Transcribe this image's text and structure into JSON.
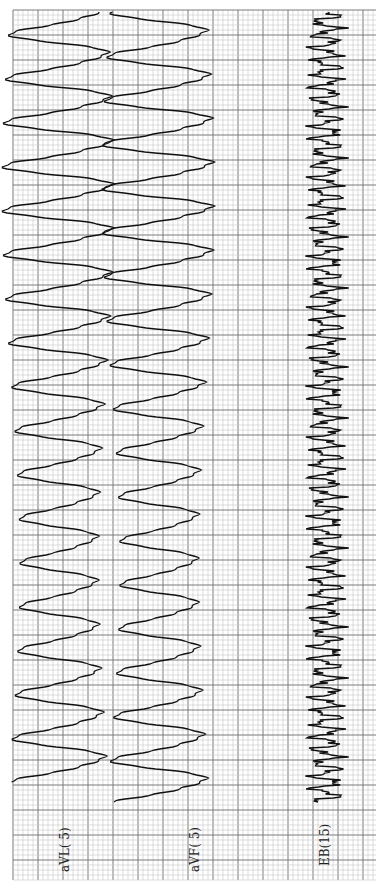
{
  "chart_data": {
    "type": "line",
    "title": "",
    "orientation": "rotated-90 (time runs top to bottom)",
    "grid": {
      "x0": 13,
      "y0": 10,
      "x1": 376,
      "y1": 880,
      "minor_px": 5,
      "major_px": 25,
      "minor_color": "#c8c8c8",
      "major_color": "#7a7a7a",
      "background": "#ffffff"
    },
    "series": [
      {
        "name": "aVL( 5)",
        "baseline_x": 62,
        "amplitude_px": 52,
        "period_px": 44,
        "phase": 0.0,
        "y_start": 12,
        "y_end": 782,
        "shape": "polymorphic-sine",
        "color": "#111111"
      },
      {
        "name": "aVF( 5)",
        "baseline_x": 162,
        "amplitude_px": 52,
        "period_px": 44,
        "phase": 3.14,
        "y_start": 12,
        "y_end": 802,
        "shape": "polymorphic-sine",
        "color": "#111111"
      },
      {
        "name": "EB(15)",
        "baseline_x": 326,
        "amplitude_px": 18,
        "period_px": 13,
        "phase": 0.4,
        "y_start": 12,
        "y_end": 802,
        "shape": "spiky",
        "color": "#111111"
      }
    ],
    "labels": [
      {
        "text": "aVL( 5)",
        "x": 58,
        "y": 872
      },
      {
        "text": "aVF( 5)",
        "x": 188,
        "y": 872
      },
      {
        "text": "EB(15)",
        "x": 318,
        "y": 866
      }
    ],
    "xlabel": "",
    "ylabel": ""
  }
}
